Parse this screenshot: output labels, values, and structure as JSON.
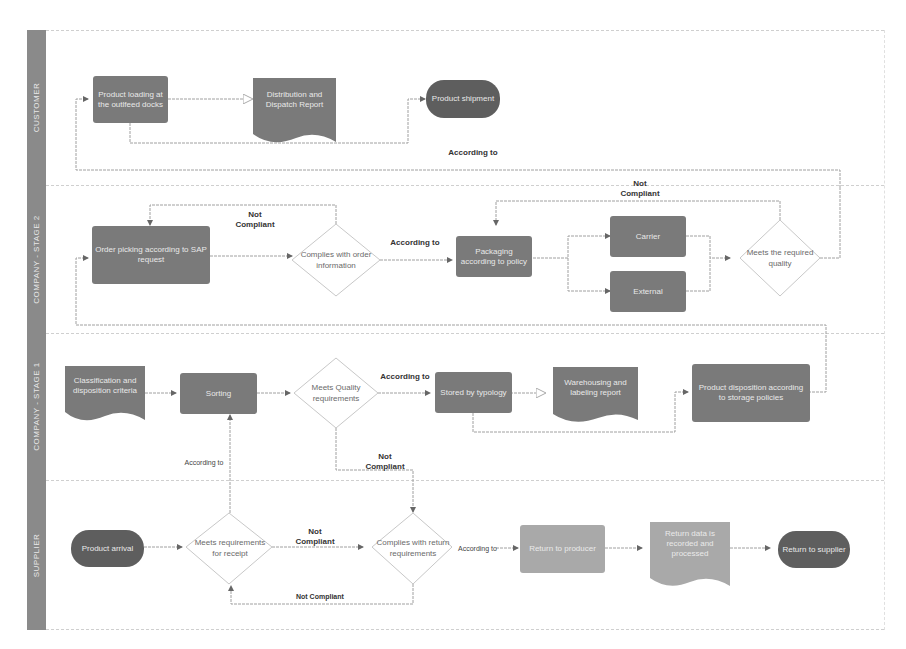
{
  "lanes": [
    {
      "label": "CUSTOMER"
    },
    {
      "label": "COMPANY - STAGE 2"
    },
    {
      "label": "COMPANY - STAGE 1"
    },
    {
      "label": "SUPPLIER"
    }
  ],
  "nodes": {
    "product_loading": "Product loading at the outlfeed docks",
    "distribution_report": "Distribution and Dispatch Report",
    "product_shipment": "Product shipment",
    "order_picking": "Order picking according to SAP request",
    "complies_order": "Complies with order information",
    "packaging": "Packaging according to policy",
    "carrier": "Carrier",
    "external": "External",
    "meets_quality": "Meets the required quality",
    "classification_criteria": "Classification and disposition criteria",
    "sorting": "Sorting",
    "meets_quality_req": "Meets Quality requirements",
    "stored_typology": "Stored by typology",
    "warehousing_report": "Warehousing and labeling report",
    "product_disposition": "Product disposition according to storage policies",
    "product_arrival": "Product arrival",
    "meets_receipt": "Meets requirements for receipt",
    "complies_return": "Complies with return requirements",
    "return_producer": "Return to producer",
    "return_data": "Return data is recorded and processed",
    "return_supplier": "Return to supplier"
  },
  "edge_labels": {
    "according_to_top": "According to",
    "not_compliant_order": "Not Compliant",
    "according_to_order": "According to",
    "not_compliant_quality": "Not Compliant",
    "according_to_stage1": "According to",
    "not_compliant_stage1": "Not Compliant",
    "according_to_receipt": "According to",
    "not_compliant_receipt": "Not Compliant",
    "according_to_return": "According to",
    "not_compliant_bottom": "Not Compliant"
  },
  "colors": {
    "lane_bar": "#8a8a8a",
    "process": "#7a7a7a",
    "process_light": "#a9a9a9",
    "terminal": "#5e5e5e",
    "edge": "#9a9a9a"
  }
}
